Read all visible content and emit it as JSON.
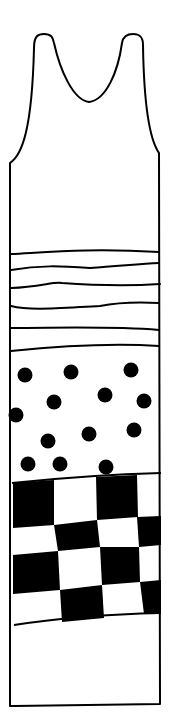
{
  "drawing": {
    "subject": "tank dress line drawing",
    "colors": {
      "ink": "#000000",
      "paper": "#ffffff"
    },
    "sections": [
      "plain top",
      "horizontal stripes",
      "polka dots",
      "checkerboard",
      "plain hem"
    ]
  }
}
